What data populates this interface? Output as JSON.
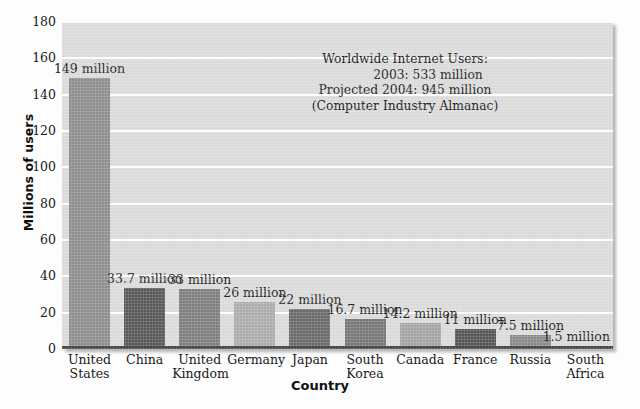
{
  "chart_data": {
    "type": "bar",
    "title": "",
    "xlabel": "Country",
    "ylabel": "Millions of users",
    "ylim": [
      0,
      180
    ],
    "ytick_step": 20,
    "yticks": [
      "180",
      "160",
      "140",
      "120",
      "100",
      "80",
      "60",
      "40",
      "20",
      "0"
    ],
    "grid": "horizontal",
    "legend": "none",
    "categories": [
      "United States",
      "China",
      "United Kingdom",
      "Germany",
      "Japan",
      "South Korea",
      "Canada",
      "France",
      "Russia",
      "South Africa"
    ],
    "category_lines": [
      [
        "United",
        "States"
      ],
      [
        "China",
        ""
      ],
      [
        "United",
        "Kingdom"
      ],
      [
        "Germany",
        ""
      ],
      [
        "Japan",
        ""
      ],
      [
        "South",
        "Korea"
      ],
      [
        "Canada",
        ""
      ],
      [
        "France",
        ""
      ],
      [
        "Russia",
        ""
      ],
      [
        "South",
        "Africa"
      ]
    ],
    "values": [
      149,
      33.7,
      33,
      26,
      22,
      16.7,
      14.2,
      11,
      7.5,
      1.5
    ],
    "data_labels": [
      "149 million",
      "33.7 million",
      "33 million",
      "26 million",
      "22 million",
      "16.7 million",
      "14.2 million",
      "11 million",
      "7.5 million",
      "1.5 million"
    ],
    "bar_colors": [
      "#8e8e8e",
      "#585858",
      "#7e7e7e",
      "#acacac",
      "#6a6a6a",
      "#777777",
      "#a4a4a4",
      "#555555",
      "#8a8a8a",
      "#7a7a7a"
    ],
    "annotation": {
      "line1": "Worldwide Internet Users:",
      "line2": "2003: 533 million",
      "line3": "Projected 2004: 945 million",
      "line4": "(Computer Industry Almanac)"
    }
  },
  "colors": {
    "plot_background": "#dadada",
    "gridline": "#fdfdfd",
    "axis": "#454545",
    "figure_background": "#fdfdfd",
    "text": "#1a1a1a"
  }
}
